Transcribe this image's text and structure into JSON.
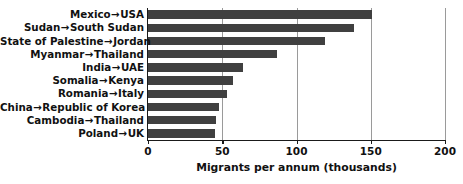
{
  "chart_data": {
    "type": "bar",
    "orientation": "horizontal",
    "title": "",
    "xlabel": "Migrants per annum (thousands)",
    "ylabel": "",
    "xlim": [
      0,
      200
    ],
    "xticks": [
      0,
      50,
      100,
      150,
      200
    ],
    "xtick_labels": [
      "0",
      "50",
      "100",
      "150",
      "200"
    ],
    "grid": "vertical gridlines at 50, 100, 150",
    "legend": "none",
    "bar_color": "#404040",
    "categories": [
      "Mexico → USA",
      "Sudan → South Sudan",
      "State of Palestine → Jordan",
      "Myanmar → Thailand",
      "India → UAE",
      "Somalia → Kenya",
      "Romania → Italy",
      "China → Republic of Korea",
      "Cambodia → Thailand",
      "Poland → UK"
    ],
    "origins": [
      "Mexico",
      "Sudan",
      "State of Palestine",
      "Myanmar",
      "India",
      "Somalia",
      "Romania",
      "China",
      "Cambodia",
      "Poland"
    ],
    "destinations": [
      "USA",
      "South Sudan",
      "Jordan",
      "Thailand",
      "UAE",
      "Kenya",
      "Italy",
      "Republic of Korea",
      "Thailand",
      "UK"
    ],
    "values": [
      151,
      139,
      119,
      87,
      64,
      57,
      53,
      48,
      46,
      45
    ],
    "arrow_glyph": "→"
  }
}
